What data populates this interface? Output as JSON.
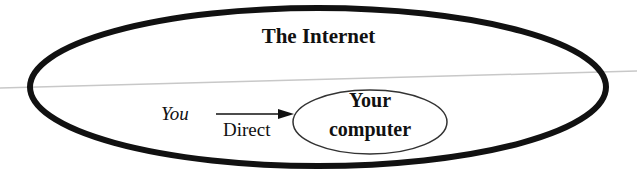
{
  "diagram": {
    "outer_region": {
      "label": "The Internet",
      "shape": "ellipse",
      "stroke_color": "#111111"
    },
    "source": {
      "label": "You",
      "style": "italic"
    },
    "edge": {
      "label": "Direct",
      "from": "You",
      "to": "Your computer",
      "type": "arrow"
    },
    "target_node": {
      "line1": "Your",
      "line2": "computer",
      "shape": "ellipse"
    },
    "background_line_color": "#c8c8c8"
  }
}
